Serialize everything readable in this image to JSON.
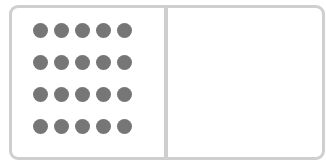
{
  "diagram": {
    "type": "ten-frame-style two-part box",
    "left_panel": {
      "dot_rows": 4,
      "dot_cols": 5,
      "dot_count": 20
    },
    "right_panel": {
      "dot_count": 0
    },
    "colors": {
      "border": "#cfcfcf",
      "dot": "#767676",
      "background": "#ffffff"
    }
  }
}
